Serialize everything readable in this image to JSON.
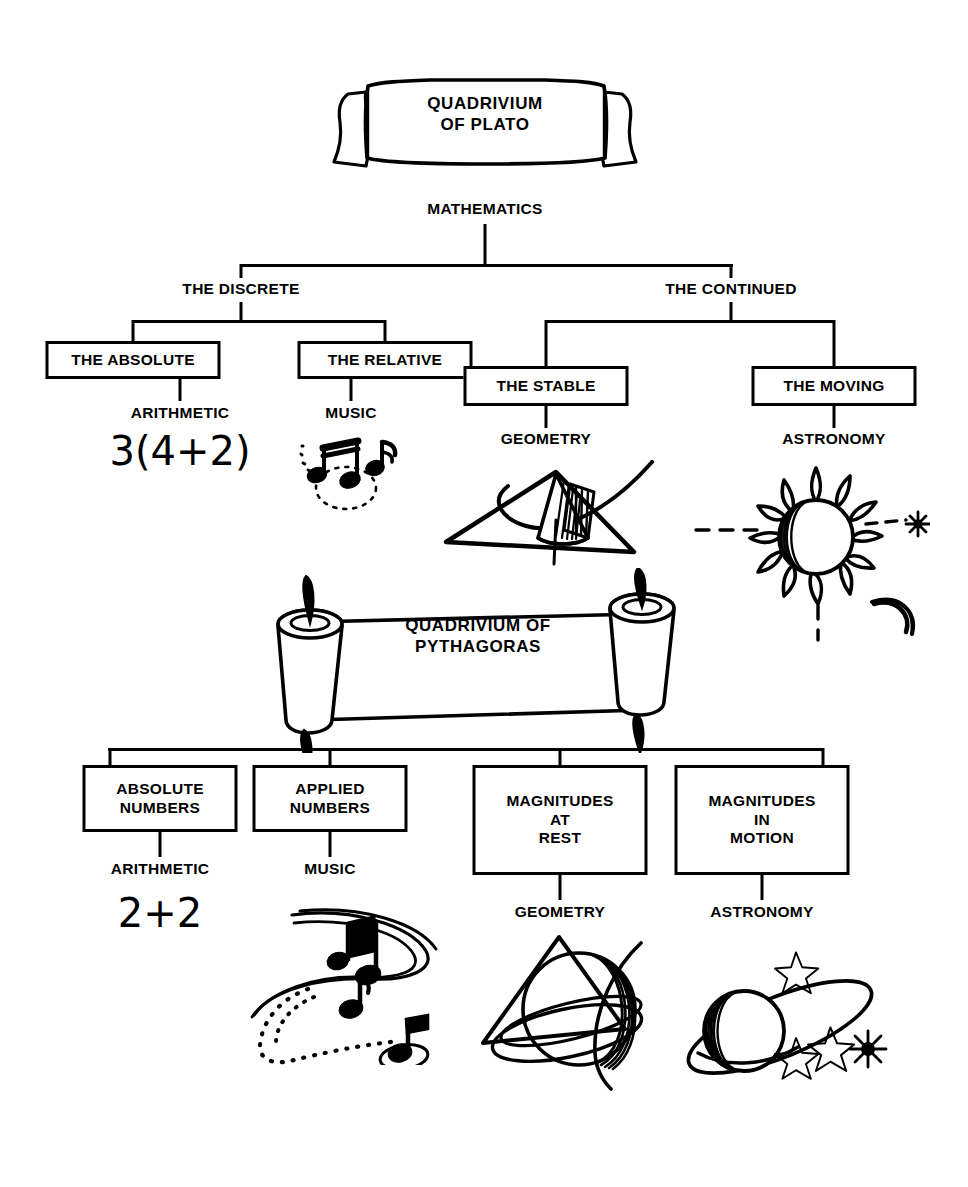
{
  "page": {
    "background_color": "#ffffff",
    "ink_color": "#000000",
    "width": 968,
    "height": 1187
  },
  "plato": {
    "banner": {
      "name": "quadrivium-of-plato-banner",
      "text": "QUADRIVIUM\nOF PLATO"
    },
    "root": {
      "label": "MATHEMATICS"
    },
    "branches": [
      {
        "label": "THE DISCRETE"
      },
      {
        "label": "THE CONTINUED"
      }
    ],
    "boxes": [
      {
        "label": "THE ABSOLUTE"
      },
      {
        "label": "THE RELATIVE"
      },
      {
        "label": "THE STABLE"
      },
      {
        "label": "THE MOVING"
      }
    ],
    "arts": [
      {
        "label": "ARITHMETIC",
        "expression": "3(4+2)",
        "icon": "arithmetic-expression"
      },
      {
        "label": "MUSIC",
        "icon": "music-notes-icon"
      },
      {
        "label": "GEOMETRY",
        "icon": "geometry-cone-triangle-icon"
      },
      {
        "label": "ASTRONOMY",
        "icon": "sun-moon-star-icon"
      }
    ]
  },
  "pythagoras": {
    "banner": {
      "name": "quadrivium-of-pythagoras-scroll",
      "text": "QUADRIVIUM OF\nPYTHAGORAS"
    },
    "boxes": [
      {
        "label": "ABSOLUTE\nNUMBERS"
      },
      {
        "label": "APPLIED\nNUMBERS"
      },
      {
        "label": "MAGNITUDES\nAT\nREST"
      },
      {
        "label": "MAGNITUDES\nIN\nMOTION"
      }
    ],
    "arts": [
      {
        "label": "ARITHMETIC",
        "expression": "2+2",
        "icon": "arithmetic-expression"
      },
      {
        "label": "MUSIC",
        "icon": "music-notes-swirl-icon"
      },
      {
        "label": "GEOMETRY",
        "icon": "geometry-sphere-triangle-icon"
      },
      {
        "label": "ASTRONOMY",
        "icon": "ringed-planet-stars-icon"
      }
    ]
  }
}
